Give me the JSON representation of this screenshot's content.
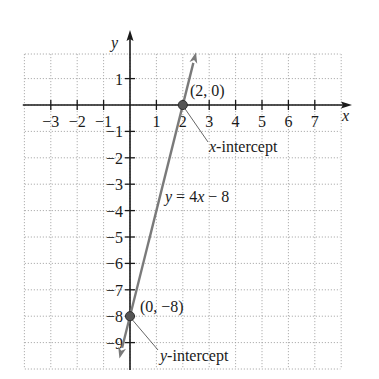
{
  "chart_data": {
    "type": "line",
    "title": "",
    "equation": "y = 4x − 8",
    "xlabel": "x",
    "ylabel": "y",
    "xlim": [
      -4,
      8
    ],
    "ylim": [
      -10,
      2
    ],
    "grid": true,
    "x_ticks": [
      -3,
      -2,
      -1,
      1,
      2,
      3,
      4,
      5,
      6,
      7
    ],
    "x_tick_labels": [
      "−3",
      "−2",
      "−1",
      "1",
      "2",
      "3",
      "4",
      "5",
      "6",
      "7"
    ],
    "y_ticks": [
      1,
      -1,
      -2,
      -3,
      -4,
      -5,
      -6,
      -7,
      -8,
      -9
    ],
    "y_tick_labels": [
      "1",
      "−1",
      "−2",
      "−3",
      "−4",
      "−5",
      "−6",
      "−7",
      "−8",
      "−9"
    ],
    "series": [
      {
        "name": "y = 4x − 8",
        "slope": 4,
        "intercept": -8,
        "x": [
          -0.4,
          2.5
        ],
        "y": [
          -9.6,
          2.0
        ],
        "color": "#7a7a7a"
      }
    ],
    "points": [
      {
        "x": 2,
        "y": 0,
        "label": "(2, 0)",
        "annotation": "x-intercept"
      },
      {
        "x": 0,
        "y": -8,
        "label": "(0, −8)",
        "annotation": "y-intercept"
      }
    ]
  },
  "labels": {
    "x_axis": "x",
    "y_axis": "y",
    "equation_y": "y",
    "equation_rest": " = 4",
    "equation_x": "x",
    "equation_tail": " − 8",
    "point_a": "(2, 0)",
    "point_b": "(0, −8)",
    "xint_var": "x",
    "xint_word": "-intercept",
    "yint_var": "y",
    "yint_word": "-intercept"
  },
  "colors": {
    "axis": "#1a1a1a",
    "grid": "#9a9a9a",
    "line": "#7a7a7a",
    "point": "#555555"
  }
}
